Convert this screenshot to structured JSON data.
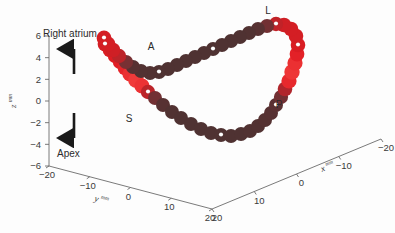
{
  "figure": {
    "name": "right-atrium-3d-loop",
    "background_color": "#fdfdfd"
  },
  "annotations": {
    "up_label": "Right atrium",
    "down_label": "Apex",
    "up_arrow_icon": "arrow-up-icon",
    "down_arrow_icon": "arrow-down-icon"
  },
  "site_labels": [
    {
      "id": "A",
      "text": "A",
      "x": 151,
      "y": 50
    },
    {
      "id": "L",
      "text": "L",
      "x": 268,
      "y": 14
    },
    {
      "id": "S",
      "text": "S",
      "x": 129,
      "y": 122
    },
    {
      "id": "P",
      "text": "P",
      "x": 279,
      "y": 108
    }
  ],
  "axes": {
    "z": {
      "title": "z",
      "title_sup": "mm",
      "ticks": [
        "6",
        "4",
        "2",
        "0",
        "-2",
        "-4",
        "-6"
      ],
      "range": [
        -6,
        6
      ]
    },
    "y": {
      "title": "y",
      "title_sup": "mm",
      "ticks": [
        "-20",
        "-10",
        "0",
        "10",
        "20"
      ],
      "range": [
        -20,
        20
      ]
    },
    "x": {
      "title": "x",
      "title_sup": "mm",
      "ticks": [
        "20",
        "10",
        "0",
        "-10",
        "-20"
      ],
      "range": [
        -20,
        20
      ]
    }
  },
  "chart_data": {
    "type": "scatter",
    "title": "",
    "xlabel": "x^mm",
    "ylabel": "y^mm",
    "zlabel": "z^mm",
    "xlim": [
      -20,
      20
    ],
    "ylim": [
      -20,
      20
    ],
    "zlim": [
      -6,
      6
    ],
    "grid": false,
    "legend": null,
    "projection": "3d",
    "colors": {
      "bead_dark": "#4a3232",
      "bead_mid": "#8c2f33",
      "bead_red": "#e01b22",
      "bead_bright": "#f03a3a",
      "marker_dot": "#ffffff"
    },
    "series": [
      {
        "name": "electrode-loop",
        "note": "screen-space polyline of bead centres (px) with per-bead colour value 0=dark brown .. 1=bright red",
        "beads": [
          {
            "x": 105,
            "y": 44,
            "c": 0.8,
            "r": 7.4,
            "marker": true
          },
          {
            "x": 110,
            "y": 50,
            "c": 0.82,
            "r": 7.3,
            "marker": false
          },
          {
            "x": 115,
            "y": 56,
            "c": 0.84,
            "r": 7.2,
            "marker": false
          },
          {
            "x": 120,
            "y": 62,
            "c": 0.86,
            "r": 7.2,
            "marker": false
          },
          {
            "x": 125,
            "y": 68,
            "c": 0.9,
            "r": 7.3,
            "marker": false
          },
          {
            "x": 130,
            "y": 74,
            "c": 0.95,
            "r": 7.6,
            "marker": false
          },
          {
            "x": 136,
            "y": 80,
            "c": 1.0,
            "r": 7.9,
            "marker": false
          },
          {
            "x": 142,
            "y": 86,
            "c": 0.96,
            "r": 7.6,
            "marker": false
          },
          {
            "x": 148,
            "y": 92,
            "c": 0.7,
            "r": 7.2,
            "marker": true
          },
          {
            "x": 155,
            "y": 98,
            "c": 0.3,
            "r": 7.0,
            "marker": false
          },
          {
            "x": 163,
            "y": 105,
            "c": 0.1,
            "r": 7.0,
            "marker": false
          },
          {
            "x": 172,
            "y": 112,
            "c": 0.05,
            "r": 7.0,
            "marker": false
          },
          {
            "x": 181,
            "y": 118,
            "c": 0.04,
            "r": 7.0,
            "marker": false
          },
          {
            "x": 191,
            "y": 124,
            "c": 0.04,
            "r": 7.0,
            "marker": false
          },
          {
            "x": 201,
            "y": 129,
            "c": 0.04,
            "r": 7.0,
            "marker": false
          },
          {
            "x": 211,
            "y": 133,
            "c": 0.04,
            "r": 7.0,
            "marker": false
          },
          {
            "x": 221,
            "y": 135,
            "c": 0.04,
            "r": 7.0,
            "marker": true
          },
          {
            "x": 231,
            "y": 136,
            "c": 0.04,
            "r": 7.0,
            "marker": false
          },
          {
            "x": 241,
            "y": 134,
            "c": 0.04,
            "r": 7.0,
            "marker": false
          },
          {
            "x": 250,
            "y": 131,
            "c": 0.05,
            "r": 7.0,
            "marker": false
          },
          {
            "x": 258,
            "y": 126,
            "c": 0.06,
            "r": 7.0,
            "marker": false
          },
          {
            "x": 265,
            "y": 120,
            "c": 0.08,
            "r": 7.0,
            "marker": false
          },
          {
            "x": 271,
            "y": 113,
            "c": 0.1,
            "r": 7.0,
            "marker": false
          },
          {
            "x": 276,
            "y": 105,
            "c": 0.12,
            "r": 7.0,
            "marker": true
          },
          {
            "x": 281,
            "y": 97,
            "c": 0.3,
            "r": 7.1,
            "marker": false
          },
          {
            "x": 285,
            "y": 89,
            "c": 0.65,
            "r": 7.3,
            "marker": false
          },
          {
            "x": 289,
            "y": 81,
            "c": 0.92,
            "r": 7.6,
            "marker": false
          },
          {
            "x": 292,
            "y": 72,
            "c": 0.98,
            "r": 7.7,
            "marker": false
          },
          {
            "x": 295,
            "y": 63,
            "c": 0.95,
            "r": 7.6,
            "marker": false
          },
          {
            "x": 297,
            "y": 54,
            "c": 0.88,
            "r": 7.4,
            "marker": false
          },
          {
            "x": 298,
            "y": 45,
            "c": 0.82,
            "r": 7.3,
            "marker": true
          },
          {
            "x": 296,
            "y": 36,
            "c": 0.8,
            "r": 7.3,
            "marker": false
          },
          {
            "x": 291,
            "y": 29,
            "c": 0.8,
            "r": 7.3,
            "marker": false
          },
          {
            "x": 284,
            "y": 25,
            "c": 0.78,
            "r": 7.3,
            "marker": false
          },
          {
            "x": 276,
            "y": 24,
            "c": 0.72,
            "r": 7.2,
            "marker": true
          },
          {
            "x": 267,
            "y": 26,
            "c": 0.3,
            "r": 7.0,
            "marker": false
          },
          {
            "x": 258,
            "y": 29,
            "c": 0.1,
            "r": 7.0,
            "marker": false
          },
          {
            "x": 249,
            "y": 33,
            "c": 0.05,
            "r": 7.0,
            "marker": false
          },
          {
            "x": 240,
            "y": 37,
            "c": 0.04,
            "r": 7.0,
            "marker": false
          },
          {
            "x": 231,
            "y": 41,
            "c": 0.04,
            "r": 7.0,
            "marker": false
          },
          {
            "x": 222,
            "y": 45,
            "c": 0.04,
            "r": 7.0,
            "marker": false
          },
          {
            "x": 213,
            "y": 49,
            "c": 0.04,
            "r": 7.0,
            "marker": true
          },
          {
            "x": 204,
            "y": 53,
            "c": 0.04,
            "r": 7.0,
            "marker": false
          },
          {
            "x": 195,
            "y": 57,
            "c": 0.04,
            "r": 7.0,
            "marker": false
          },
          {
            "x": 186,
            "y": 61,
            "c": 0.04,
            "r": 7.0,
            "marker": false
          },
          {
            "x": 177,
            "y": 65,
            "c": 0.04,
            "r": 7.0,
            "marker": false
          },
          {
            "x": 168,
            "y": 69,
            "c": 0.04,
            "r": 7.0,
            "marker": false
          },
          {
            "x": 159,
            "y": 72,
            "c": 0.04,
            "r": 7.0,
            "marker": true
          },
          {
            "x": 150,
            "y": 73,
            "c": 0.05,
            "r": 7.0,
            "marker": false
          },
          {
            "x": 141,
            "y": 71,
            "c": 0.06,
            "r": 7.0,
            "marker": false
          },
          {
            "x": 133,
            "y": 67,
            "c": 0.1,
            "r": 7.0,
            "marker": false
          },
          {
            "x": 126,
            "y": 62,
            "c": 0.35,
            "r": 7.1,
            "marker": false
          },
          {
            "x": 119,
            "y": 56,
            "c": 0.7,
            "r": 7.2,
            "marker": false
          },
          {
            "x": 113,
            "y": 50,
            "c": 0.78,
            "r": 7.3,
            "marker": false
          },
          {
            "x": 108,
            "y": 44,
            "c": 0.8,
            "r": 7.4,
            "marker": false
          },
          {
            "x": 104,
            "y": 38,
            "c": 0.8,
            "r": 7.4,
            "marker": true
          }
        ]
      }
    ]
  }
}
